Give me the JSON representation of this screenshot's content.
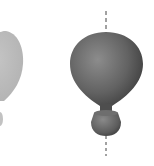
{
  "scene": {
    "background": "#ffffff",
    "objects": [
      {
        "name": "faded-balloon",
        "color": "#bdbdbd",
        "partially_visible": true
      },
      {
        "name": "shaded-balloon",
        "highlight": "#8a8a8a",
        "base": "#5e5e5e",
        "shadow": "#3a3a3a",
        "axis_style": "dashed",
        "axis_color": "#444444"
      }
    ]
  }
}
